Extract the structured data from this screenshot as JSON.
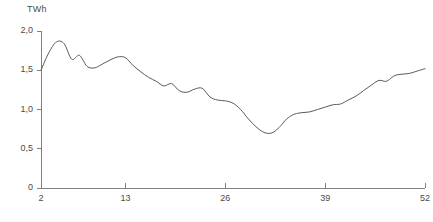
{
  "chart_data": {
    "type": "line",
    "title": "",
    "xlabel": "",
    "ylabel": "TWh",
    "unit_label": "TWh",
    "xlim": [
      2,
      52
    ],
    "ylim": [
      0,
      2.0
    ],
    "grid": false,
    "legend": "none",
    "line_color": "#595959",
    "axis_color": "#808080",
    "xticks": [
      2,
      13,
      26,
      39,
      52
    ],
    "xtick_labels": [
      "2",
      "13",
      "26",
      "39",
      "52"
    ],
    "yticks": [
      0,
      0.5,
      1.0,
      1.5,
      2.0
    ],
    "ytick_labels": [
      "0",
      "0,5",
      "1,0",
      "1,5",
      "2,0"
    ],
    "x": [
      2,
      3,
      4,
      5,
      6,
      7,
      8,
      9,
      10,
      11,
      12,
      13,
      14,
      15,
      16,
      17,
      18,
      19,
      20,
      21,
      22,
      23,
      24,
      25,
      26,
      27,
      28,
      29,
      30,
      31,
      32,
      33,
      34,
      35,
      36,
      37,
      38,
      39,
      40,
      41,
      42,
      43,
      44,
      45,
      46,
      47,
      48,
      49,
      50,
      51,
      52
    ],
    "values": [
      1.5,
      1.72,
      1.86,
      1.84,
      1.64,
      1.69,
      1.55,
      1.53,
      1.58,
      1.63,
      1.67,
      1.66,
      1.56,
      1.48,
      1.41,
      1.36,
      1.3,
      1.33,
      1.24,
      1.22,
      1.26,
      1.27,
      1.16,
      1.12,
      1.11,
      1.08,
      1.0,
      0.88,
      0.78,
      0.71,
      0.7,
      0.77,
      0.88,
      0.94,
      0.96,
      0.97,
      1.0,
      1.03,
      1.06,
      1.07,
      1.12,
      1.17,
      1.24,
      1.31,
      1.37,
      1.36,
      1.43,
      1.45,
      1.46,
      1.49,
      1.52
    ]
  },
  "axes": {
    "y_unit": "TWh"
  }
}
